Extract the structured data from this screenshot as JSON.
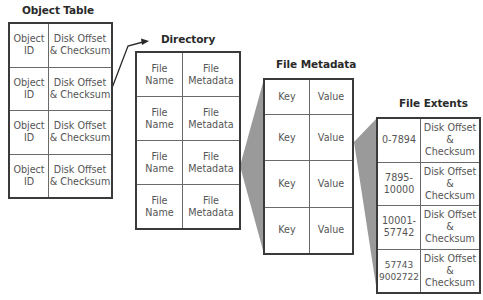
{
  "diagram": {
    "colors": {
      "border": "#3a3a3a",
      "funnel": "#9a9a9a",
      "text": "#555555",
      "title": "#2a2a2a"
    },
    "object_table": {
      "title": "Object Table",
      "rows": [
        {
          "col1": "Object\nID",
          "col2": "Disk Offset\n& Checksum"
        },
        {
          "col1": "Object\nID",
          "col2": "Disk Offset\n& Checksum"
        },
        {
          "col1": "Object\nID",
          "col2": "Disk Offset\n& Checksum"
        },
        {
          "col1": "Object\nID",
          "col2": "Disk Offset\n& Checksum"
        }
      ]
    },
    "directory": {
      "title": "Directory",
      "rows": [
        {
          "col1": "File\nName",
          "col2": "File\nMetadata"
        },
        {
          "col1": "File\nName",
          "col2": "File\nMetadata"
        },
        {
          "col1": "File\nName",
          "col2": "File\nMetadata"
        },
        {
          "col1": "File\nName",
          "col2": "File\nMetadata"
        }
      ]
    },
    "file_metadata": {
      "title": "File Metadata",
      "rows": [
        {
          "col1": "Key",
          "col2": "Value"
        },
        {
          "col1": "Key",
          "col2": "Value"
        },
        {
          "col1": "Key",
          "col2": "Value"
        },
        {
          "col1": "Key",
          "col2": "Value"
        }
      ]
    },
    "file_extents": {
      "title": "File Extents",
      "rows": [
        {
          "col1": "0-7894",
          "col2": "Disk Offset\n& Checksum"
        },
        {
          "col1": "7895-\n10000",
          "col2": "Disk Offset\n& Checksum"
        },
        {
          "col1": "10001-\n57742",
          "col2": "Disk Offset\n& Checksum"
        },
        {
          "col1": "57743\n9002722",
          "col2": "Disk Offset\n& Checksum"
        }
      ]
    },
    "connectors": [
      {
        "from": "object_table.row1",
        "to": "directory",
        "type": "arrow"
      },
      {
        "from": "directory.row3",
        "to": "file_metadata",
        "type": "expand-funnel"
      },
      {
        "from": "file_metadata.row2",
        "to": "file_extents",
        "type": "expand-funnel"
      }
    ]
  }
}
